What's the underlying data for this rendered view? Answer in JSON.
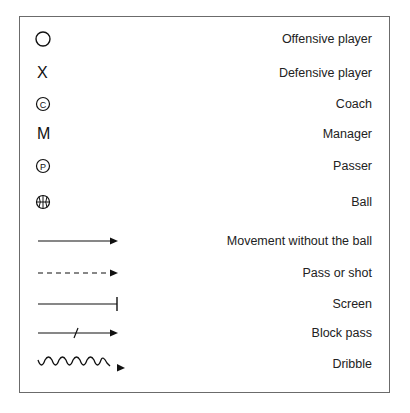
{
  "legend": {
    "items": [
      {
        "symbol": "circle-icon",
        "glyph": "",
        "label": "Offensive player"
      },
      {
        "symbol": "x-icon",
        "glyph": "X",
        "label": "Defensive player"
      },
      {
        "symbol": "circled-c-icon",
        "glyph": "C",
        "label": "Coach"
      },
      {
        "symbol": "m-letter-icon",
        "glyph": "M",
        "label": "Manager"
      },
      {
        "symbol": "circled-p-icon",
        "glyph": "P",
        "label": "Passer"
      },
      {
        "symbol": "basketball-icon",
        "glyph": "",
        "label": "Ball"
      },
      {
        "symbol": "solid-arrow-icon",
        "glyph": "",
        "label": "Movement without the ball"
      },
      {
        "symbol": "dashed-arrow-icon",
        "glyph": "",
        "label": "Pass or shot"
      },
      {
        "symbol": "screen-line-icon",
        "glyph": "",
        "label": "Screen"
      },
      {
        "symbol": "block-pass-arrow-icon",
        "glyph": "",
        "label": "Block pass"
      },
      {
        "symbol": "wavy-arrow-icon",
        "glyph": "",
        "label": "Dribble"
      }
    ]
  },
  "colors": {
    "stroke": "#111111",
    "border": "#6b6b6b",
    "text": "#222222"
  }
}
